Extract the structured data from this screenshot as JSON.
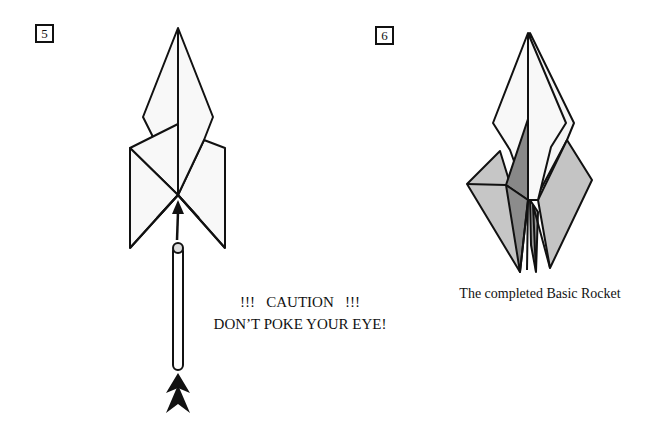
{
  "steps": [
    {
      "number": "5",
      "caution_line1": "!!!   CAUTION   !!!",
      "caution_line2": "DON’T POKE YOUR EYE!"
    },
    {
      "number": "6",
      "caption": "The completed Basic Rocket"
    }
  ],
  "colors": {
    "outline": "#111111",
    "paper_white": "#f7f7f7",
    "shade_light": "#c4c4c4",
    "shade_dark": "#8c8c8c"
  },
  "icons": {
    "push_arrow": "double-chevron-up-icon",
    "insert_arrow": "arrow-up-icon"
  }
}
